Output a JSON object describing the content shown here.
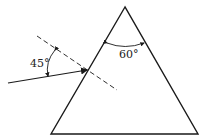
{
  "diagram": {
    "type": "prism-refraction",
    "labels": {
      "incidence_angle": "45°",
      "apex_angle": "60°"
    },
    "colors": {
      "stroke": "#1a1a1a",
      "background": "#ffffff"
    },
    "elements": {
      "prism": "equilateral-triangle",
      "normal": "dashed-line",
      "incident_ray": "ray-with-arrow"
    }
  }
}
